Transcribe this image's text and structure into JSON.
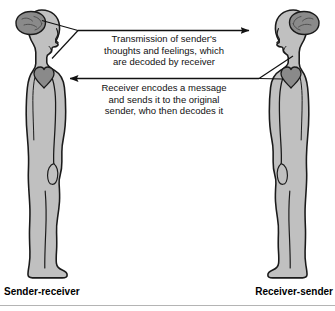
{
  "diagram": {
    "title_visible": false,
    "background_color": "#ffffff",
    "body_fill": "#c0c0c0",
    "organ_fill": "#8a8a8a",
    "outline_color": "#1a1a1a",
    "text_color": "#111111",
    "messages": {
      "top": "Transmission of sender's\nthoughts and feelings, which\nare decoded by receiver",
      "bottom": "Receiver encodes a message\nand sends it to the original\nsender, who then decodes it"
    },
    "labels": {
      "left": "Sender-receiver",
      "right": "Receiver-sender"
    },
    "figures": [
      {
        "id": "left-figure",
        "role": "Sender-receiver",
        "facing": "right",
        "organs": [
          "brain",
          "heart"
        ]
      },
      {
        "id": "right-figure",
        "role": "Receiver-sender",
        "facing": "left",
        "organs": [
          "brain",
          "heart"
        ]
      }
    ],
    "arrows": [
      {
        "id": "arrow-top",
        "direction": "right",
        "from": "left-figure-brain",
        "to": "right-figure-brain",
        "message_key": "top"
      },
      {
        "id": "arrow-bottom",
        "direction": "left",
        "from": "right-figure-heart",
        "to": "left-figure-heart",
        "message_key": "bottom"
      }
    ]
  }
}
